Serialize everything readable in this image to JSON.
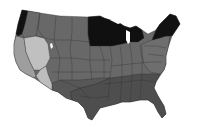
{
  "map": {
    "type": "choropleth",
    "region": "contiguous-united-states",
    "palette": {
      "darkest": "#101010",
      "dark": "#4a4a4a",
      "medium_dark": "#5a5a5a",
      "medium": "#6a6a6a",
      "light": "#9c9c9c",
      "lightest": "#bdbdbd",
      "background": "#ffffff"
    },
    "regions": [
      {
        "name": "pacific-northwest-coast",
        "shade": "darkest"
      },
      {
        "name": "oregon-interior",
        "shade": "medium"
      },
      {
        "name": "california-coast",
        "shade": "light"
      },
      {
        "name": "nevada-great-basin",
        "shade": "lightest"
      },
      {
        "name": "southeast-california-desert",
        "shade": "lightest"
      },
      {
        "name": "mountain-west",
        "shade": "medium"
      },
      {
        "name": "northern-plains",
        "shade": "medium"
      },
      {
        "name": "upper-midwest",
        "shade": "darkest"
      },
      {
        "name": "central-plains",
        "shade": "medium"
      },
      {
        "name": "midwest",
        "shade": "medium"
      },
      {
        "name": "south-central",
        "shade": "medium_dark"
      },
      {
        "name": "southeast",
        "shade": "dark"
      },
      {
        "name": "mid-atlantic",
        "shade": "medium"
      },
      {
        "name": "northern-new-england",
        "shade": "darkest"
      }
    ]
  }
}
